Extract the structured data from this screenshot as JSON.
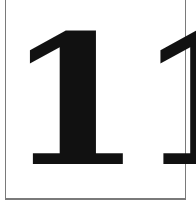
{
  "card": {
    "numeral": "11",
    "colors": {
      "text": "#111111",
      "border": "#7a7a7a",
      "background": "#ffffff"
    }
  }
}
